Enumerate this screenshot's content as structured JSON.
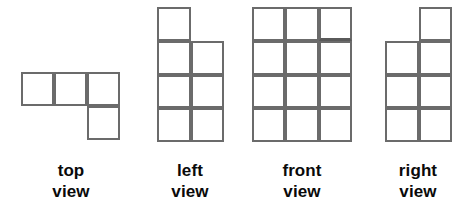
{
  "figure": {
    "title": "",
    "background_color": "#ffffff",
    "stroke_color": "#6b6b6b",
    "accent_stroke_color": "#5a5a5a",
    "text_color": "#0a0a0a",
    "cell_size_px": 33
  },
  "views": [
    {
      "id": "top",
      "label_line1": "top",
      "label_line2": "view",
      "origin": {
        "x": 21,
        "y": 72
      },
      "cell_w": 33,
      "cell_h": 34,
      "columns": 3,
      "rows": 2,
      "filled_cells": [
        {
          "col": 0,
          "row": 0
        },
        {
          "col": 1,
          "row": 0
        },
        {
          "col": 2,
          "row": 0
        },
        {
          "col": 2,
          "row": 1
        }
      ],
      "cell_count": 4,
      "label_center_x": 71,
      "label_top_y": 160
    },
    {
      "id": "left",
      "label_line1": "left",
      "label_line2": "view",
      "origin": {
        "x": 157,
        "y": 7
      },
      "cell_w": 33.5,
      "cell_h": 33.75,
      "columns": 2,
      "rows": 4,
      "filled_cells": [
        {
          "col": 0,
          "row": 0
        },
        {
          "col": 0,
          "row": 1
        },
        {
          "col": 1,
          "row": 1
        },
        {
          "col": 0,
          "row": 2
        },
        {
          "col": 1,
          "row": 2
        },
        {
          "col": 0,
          "row": 3
        },
        {
          "col": 1,
          "row": 3
        }
      ],
      "cell_count": 7,
      "label_center_x": 190,
      "label_top_y": 160
    },
    {
      "id": "front",
      "label_line1": "front",
      "label_line2": "view",
      "origin": {
        "x": 252,
        "y": 7
      },
      "cell_w": 33.3,
      "cell_h": 33.75,
      "columns": 3,
      "rows": 4,
      "filled_cells": [
        {
          "col": 0,
          "row": 0
        },
        {
          "col": 1,
          "row": 0
        },
        {
          "col": 2,
          "row": 0,
          "accent": true
        },
        {
          "col": 0,
          "row": 1
        },
        {
          "col": 1,
          "row": 1
        },
        {
          "col": 2,
          "row": 1
        },
        {
          "col": 0,
          "row": 2
        },
        {
          "col": 1,
          "row": 2
        },
        {
          "col": 2,
          "row": 2
        },
        {
          "col": 0,
          "row": 3
        },
        {
          "col": 1,
          "row": 3
        },
        {
          "col": 2,
          "row": 3
        }
      ],
      "cell_count": 12,
      "label_center_x": 302,
      "label_top_y": 160
    },
    {
      "id": "right",
      "label_line1": "right",
      "label_line2": "view",
      "origin": {
        "x": 385,
        "y": 7
      },
      "cell_w": 33.5,
      "cell_h": 33.75,
      "columns": 2,
      "rows": 4,
      "filled_cells": [
        {
          "col": 1,
          "row": 0
        },
        {
          "col": 0,
          "row": 1
        },
        {
          "col": 1,
          "row": 1
        },
        {
          "col": 0,
          "row": 2
        },
        {
          "col": 1,
          "row": 2
        },
        {
          "col": 0,
          "row": 3
        },
        {
          "col": 1,
          "row": 3
        }
      ],
      "cell_count": 7,
      "label_center_x": 418,
      "label_top_y": 160
    }
  ]
}
